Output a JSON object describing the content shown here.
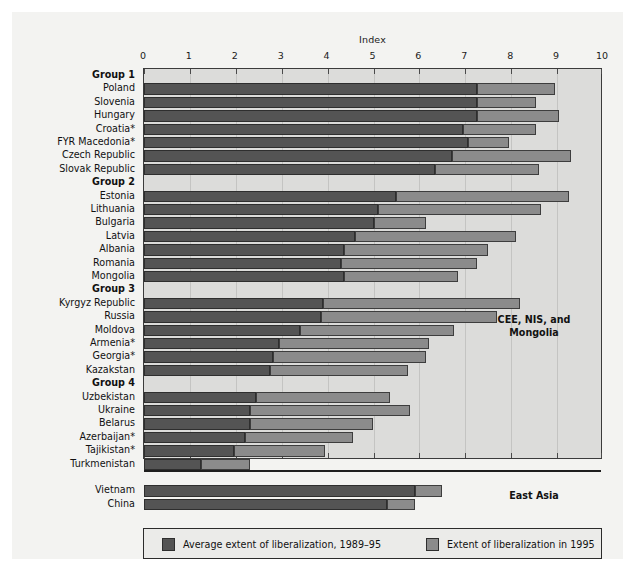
{
  "chart_data": {
    "type": "bar",
    "orientation": "horizontal",
    "stacked": false,
    "title": "",
    "xlabel": "Index",
    "ylabel": "",
    "xlim": [
      0,
      10
    ],
    "xticks": [
      0,
      1,
      2,
      3,
      4,
      5,
      6,
      7,
      8,
      9,
      10
    ],
    "xticklabels": [
      "0",
      "1",
      "2",
      "3",
      "4",
      "5",
      "6",
      "7",
      "8",
      "9",
      "10"
    ],
    "grid": true,
    "legend_position": "bottom",
    "series": [
      {
        "name": "Average extent of liberalization, 1989–95",
        "color": "#545454"
      },
      {
        "name": "Extent of liberalization in 1995",
        "color": "#8b8b8b"
      }
    ],
    "annotations": [
      {
        "text": "CEE, NIS, and Mongolia",
        "position": "right-upper"
      },
      {
        "text": "East Asia",
        "position": "right-lower"
      }
    ],
    "regions": [
      {
        "name": "CEE, NIS, and Mongolia",
        "rows": [
          {
            "label": "Group 1",
            "type": "group"
          },
          {
            "label": "Poland",
            "type": "data",
            "average": 7.25,
            "extent_1995": 8.95
          },
          {
            "label": "Slovenia",
            "type": "data",
            "average": 7.25,
            "extent_1995": 8.55
          },
          {
            "label": "Hungary",
            "type": "data",
            "average": 7.25,
            "extent_1995": 9.05
          },
          {
            "label": "Croatia*",
            "type": "data",
            "average": 6.95,
            "extent_1995": 8.55
          },
          {
            "label": "FYR Macedonia*",
            "type": "data",
            "average": 7.05,
            "extent_1995": 7.95
          },
          {
            "label": "Czech Republic",
            "type": "data",
            "average": 6.7,
            "extent_1995": 9.3
          },
          {
            "label": "Slovak Republic",
            "type": "data",
            "average": 6.35,
            "extent_1995": 8.6
          },
          {
            "label": "Group 2",
            "type": "group"
          },
          {
            "label": "Estonia",
            "type": "data",
            "average": 5.5,
            "extent_1995": 9.25
          },
          {
            "label": "Lithuania",
            "type": "data",
            "average": 5.1,
            "extent_1995": 8.65
          },
          {
            "label": "Bulgaria",
            "type": "data",
            "average": 5.0,
            "extent_1995": 6.15
          },
          {
            "label": "Latvia",
            "type": "data",
            "average": 4.6,
            "extent_1995": 8.1
          },
          {
            "label": "Albania",
            "type": "data",
            "average": 4.35,
            "extent_1995": 7.5
          },
          {
            "label": "Romania",
            "type": "data",
            "average": 4.3,
            "extent_1995": 7.25
          },
          {
            "label": "Mongolia",
            "type": "data",
            "average": 4.35,
            "extent_1995": 6.85
          },
          {
            "label": "Group 3",
            "type": "group"
          },
          {
            "label": "Kyrgyz Republic",
            "type": "data",
            "average": 3.9,
            "extent_1995": 8.2
          },
          {
            "label": "Russia",
            "type": "data",
            "average": 3.85,
            "extent_1995": 7.7
          },
          {
            "label": "Moldova",
            "type": "data",
            "average": 3.4,
            "extent_1995": 6.75
          },
          {
            "label": "Armenia*",
            "type": "data",
            "average": 2.95,
            "extent_1995": 6.2
          },
          {
            "label": "Georgia*",
            "type": "data",
            "average": 2.8,
            "extent_1995": 6.15
          },
          {
            "label": "Kazakstan",
            "type": "data",
            "average": 2.75,
            "extent_1995": 5.75
          },
          {
            "label": "Group 4",
            "type": "group"
          },
          {
            "label": "Uzbekistan",
            "type": "data",
            "average": 2.45,
            "extent_1995": 5.35
          },
          {
            "label": "Ukraine",
            "type": "data",
            "average": 2.3,
            "extent_1995": 5.8
          },
          {
            "label": "Belarus",
            "type": "data",
            "average": 2.3,
            "extent_1995": 5.0
          },
          {
            "label": "Azerbaijan*",
            "type": "data",
            "average": 2.2,
            "extent_1995": 4.55
          },
          {
            "label": "Tajikistan*",
            "type": "data",
            "average": 1.95,
            "extent_1995": 3.95
          },
          {
            "label": "Turkmenistan",
            "type": "data",
            "average": 1.25,
            "extent_1995": 2.3
          }
        ]
      },
      {
        "name": "East Asia",
        "rows": [
          {
            "label": "",
            "type": "spacer"
          },
          {
            "label": "Vietnam",
            "type": "data",
            "average": 5.9,
            "extent_1995": 6.5
          },
          {
            "label": "China",
            "type": "data",
            "average": 5.3,
            "extent_1995": 5.9
          }
        ]
      }
    ]
  },
  "legend": {
    "items": [
      {
        "label": "Average extent of liberalization, 1989–95",
        "swatch": "dark"
      },
      {
        "label": "Extent of liberalization in 1995",
        "swatch": "light"
      }
    ]
  },
  "colors": {
    "bar_dark": "#545454",
    "bar_light": "#8b8b8b",
    "plot_background": "#dcdcda",
    "page_background": "#f3f3f1",
    "axis": "#3b3b3b"
  }
}
